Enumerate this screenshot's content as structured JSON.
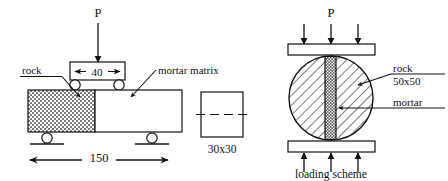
{
  "figure": {
    "colors": {
      "line": "#111111",
      "background": "#ffffff",
      "rock_fill": "#b8b8b8",
      "mortar_fill": "#ffffff",
      "hatch": "#111111"
    }
  },
  "beam_diagram": {
    "load_label": "P",
    "rock_label": "rock",
    "mortar_label": "mortar matrix",
    "span_dimension": "150",
    "loading_block_dimension": "40"
  },
  "cross_section": {
    "dimension_label": "30x30"
  },
  "disc_diagram": {
    "load_label": "P",
    "rock_label": "rock",
    "rock_size_label": "50x50",
    "mortar_label": "mortar",
    "caption": "loading scheme"
  }
}
